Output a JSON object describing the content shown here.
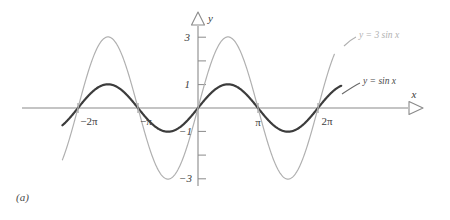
{
  "figure": {
    "caption": "(a)",
    "axes": {
      "x_axis_label": "x",
      "y_axis_label": "y",
      "x_tick_labels": [
        "−2π",
        "−π",
        "π",
        "2π"
      ],
      "y_tick_labels": [
        "3",
        "1",
        "−1",
        "−3"
      ]
    },
    "annotations": {
      "curve_label_scaled": "y = 3 sin x",
      "curve_label_base": "y = sin x"
    },
    "colors": {
      "base_curve": "#3c3c3c",
      "scaled_curve": "#b0b0b0",
      "axis": "#8a8a8a",
      "text": "#404040",
      "background": "#ffffff"
    }
  },
  "chart_data": {
    "type": "line",
    "title": "",
    "subtitle": "",
    "xlabel": "x",
    "ylabel": "y",
    "xlim": [
      -7.3,
      7.6
    ],
    "ylim": [
      -3.6,
      3.6
    ],
    "grid": false,
    "legend_position": "inline-right",
    "x_ticks": [
      -6.2832,
      -3.1416,
      3.1416,
      6.2832
    ],
    "x_tick_labels": [
      "−2π",
      "−π",
      "π",
      "2π"
    ],
    "y_ticks": [
      -3,
      -2,
      -1,
      1,
      2,
      3
    ],
    "y_tick_labels_shown": {
      "3": "3",
      "1": "1",
      "-1": "−1",
      "-3": "−3"
    },
    "series": [
      {
        "name": "y = sin x",
        "color": "#3c3c3c",
        "amplitude": 1,
        "period": 6.2832,
        "linewidth": 2.2,
        "x_start": -7.1,
        "x_end": 7.5,
        "key_points": [
          {
            "x": -6.2832,
            "y": 0
          },
          {
            "x": -4.7124,
            "y": 1
          },
          {
            "x": -3.1416,
            "y": 0
          },
          {
            "x": -1.5708,
            "y": -1
          },
          {
            "x": 0,
            "y": 0
          },
          {
            "x": 1.5708,
            "y": 1
          },
          {
            "x": 3.1416,
            "y": 0
          },
          {
            "x": 4.7124,
            "y": -1
          },
          {
            "x": 6.2832,
            "y": 0
          }
        ]
      },
      {
        "name": "y = 3 sin x",
        "color": "#b0b0b0",
        "amplitude": 3,
        "period": 6.2832,
        "linewidth": 1.2,
        "x_start": -7.1,
        "x_end": 7.15,
        "key_points": [
          {
            "x": -6.2832,
            "y": 0
          },
          {
            "x": -4.7124,
            "y": 3
          },
          {
            "x": -3.1416,
            "y": 0
          },
          {
            "x": -1.5708,
            "y": -3
          },
          {
            "x": 0,
            "y": 0
          },
          {
            "x": 1.5708,
            "y": 3
          },
          {
            "x": 3.1416,
            "y": 0
          },
          {
            "x": 4.7124,
            "y": -3
          },
          {
            "x": 6.2832,
            "y": 0
          }
        ]
      }
    ],
    "annotations": [
      {
        "text": "y = 3 sin x",
        "color": "#b0b0b0"
      },
      {
        "text": "y = sin x",
        "color": "#4a4a4a"
      }
    ]
  }
}
